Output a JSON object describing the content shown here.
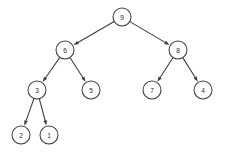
{
  "diagram": {
    "type": "directed-tree",
    "background_color": "#ffffff",
    "node_stroke_color": "#3c3c3c",
    "node_fill_color": "#ffffff",
    "edge_color": "#3c3c3c",
    "label_color": "#2b2b2b",
    "node_radius": 9,
    "nodes": [
      {
        "id": "n9",
        "label": "9",
        "x": 122,
        "y": 17,
        "level": 0
      },
      {
        "id": "n6",
        "label": "6",
        "x": 65,
        "y": 50,
        "level": 1
      },
      {
        "id": "n8",
        "label": "8",
        "x": 178,
        "y": 50,
        "level": 1
      },
      {
        "id": "n3",
        "label": "3",
        "x": 37,
        "y": 90,
        "level": 2
      },
      {
        "id": "n5",
        "label": "5",
        "x": 91,
        "y": 90,
        "level": 2
      },
      {
        "id": "n7",
        "label": "7",
        "x": 152,
        "y": 90,
        "level": 2
      },
      {
        "id": "n4",
        "label": "4",
        "x": 203,
        "y": 90,
        "level": 2
      },
      {
        "id": "n2",
        "label": "2",
        "x": 21,
        "y": 135,
        "level": 3
      },
      {
        "id": "n1",
        "label": "1",
        "x": 49,
        "y": 135,
        "level": 3
      }
    ],
    "edges": [
      {
        "id": "e-9-6",
        "from": "n9",
        "to": "n6",
        "directed": true
      },
      {
        "id": "e-9-8",
        "from": "n9",
        "to": "n8",
        "directed": true
      },
      {
        "id": "e-6-3",
        "from": "n6",
        "to": "n3",
        "directed": true
      },
      {
        "id": "e-6-5",
        "from": "n6",
        "to": "n5",
        "directed": true
      },
      {
        "id": "e-8-7",
        "from": "n8",
        "to": "n7",
        "directed": true
      },
      {
        "id": "e-8-4",
        "from": "n8",
        "to": "n4",
        "directed": true
      },
      {
        "id": "e-3-2",
        "from": "n3",
        "to": "n2",
        "directed": true
      },
      {
        "id": "e-3-1",
        "from": "n3",
        "to": "n1",
        "directed": true
      }
    ]
  }
}
